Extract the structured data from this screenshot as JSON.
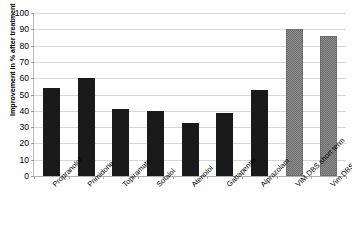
{
  "chart_data": {
    "type": "bar",
    "title": "",
    "xlabel": "",
    "ylabel": "Improvement in % after treatment",
    "ylim": [
      0,
      100
    ],
    "yticks": [
      0,
      10,
      20,
      30,
      40,
      50,
      60,
      70,
      80,
      90,
      100
    ],
    "grid": true,
    "legend": "none",
    "categories": [
      "Propranolol",
      "Primidone",
      "Topiramate",
      "Sotalol",
      "Atenolol",
      "Gabapentin",
      "Alprazolam",
      "VIM DBS short term",
      "Vim DBS long-term"
    ],
    "values": [
      54,
      60,
      41,
      40,
      32.5,
      38.5,
      53,
      90,
      86
    ],
    "bar_styles": [
      "solid-black",
      "solid-black",
      "solid-black",
      "solid-black",
      "solid-black",
      "solid-black",
      "solid-black",
      "gray-checkered",
      "gray-checkered"
    ]
  },
  "colors": {
    "bar_solid": "#1a1a1a",
    "bar_hatch": "#8d8d8d",
    "gridline": "#d6d6d6",
    "axis": "#b8b8b8",
    "background": "#ffffff",
    "text": "#000000"
  }
}
